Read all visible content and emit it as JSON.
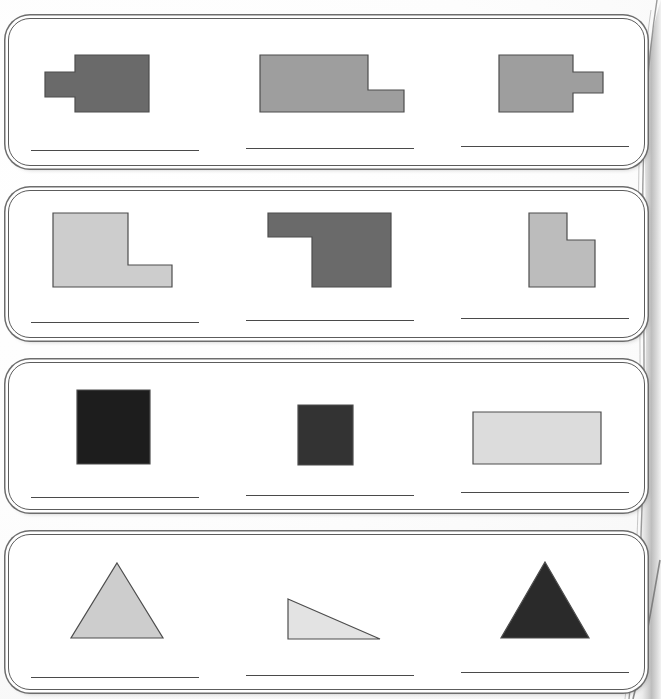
{
  "document": {
    "kind": "scanned-worksheet-page",
    "width": 661,
    "height": 699,
    "panel_count": 4,
    "shapes_per_panel": 3,
    "answer_lines_per_panel": 3
  },
  "palette": {
    "page_background": "#ffffff",
    "panel_fill": "#ffffff",
    "panel_border": "#5c5c5c",
    "panel_outer_border": "#6d6d6d",
    "answer_line": "#4a4a4a",
    "shape_outline": "#4d4d4d",
    "gray_dark": "#6a6a6a",
    "gray_medium": "#9e9e9e",
    "gray_light": "#bcbcbc",
    "gray_lighter": "#cdcdcd",
    "gray_palest": "#dcdcdc",
    "near_black": "#1d1d1d",
    "charcoal": "#333333"
  },
  "panels": [
    {
      "id": "panel-1",
      "index": 1,
      "frame": {
        "x": 8,
        "y": 18,
        "w": 637,
        "h": 148
      },
      "shapes": [
        {
          "id": "shape-1-1",
          "name": "rectangle-with-left-tab",
          "fill": "#6a6a6a",
          "box": {
            "x": 44,
            "y": 54,
            "w": 104,
            "h": 57
          },
          "viewbox": "0 0 104 57",
          "points": "30,0 104,0 104,57 30,57 30,42 0,42 0,17 30,17"
        },
        {
          "id": "shape-1-2",
          "name": "l-shape-step-down-right",
          "fill": "#9e9e9e",
          "box": {
            "x": 259,
            "y": 54,
            "w": 144,
            "h": 57
          },
          "viewbox": "0 0 144 57",
          "points": "0,0 108,0 108,35 144,35 144,57 0,57"
        },
        {
          "id": "shape-1-3",
          "name": "rectangle-with-right-tab",
          "fill": "#9e9e9e",
          "box": {
            "x": 498,
            "y": 54,
            "w": 104,
            "h": 57
          },
          "viewbox": "0 0 104 57",
          "points": "0,0 74,0 74,17 104,17 104,38 74,38 74,57 0,57"
        }
      ],
      "answer_lines": [
        {
          "x": 30,
          "y": 149,
          "w": 168
        },
        {
          "x": 245,
          "y": 147,
          "w": 168
        },
        {
          "x": 460,
          "y": 145,
          "w": 168
        }
      ]
    },
    {
      "id": "panel-2",
      "index": 2,
      "frame": {
        "x": 8,
        "y": 190,
        "w": 637,
        "h": 148
      },
      "shapes": [
        {
          "id": "shape-2-1",
          "name": "l-shape-notch-top-right",
          "fill": "#cdcdcd",
          "box": {
            "x": 52,
            "y": 212,
            "w": 119,
            "h": 74
          },
          "viewbox": "0 0 119 74",
          "points": "0,0 75,0 75,52 119,52 119,74 0,74"
        },
        {
          "id": "shape-2-2",
          "name": "l-shape-notch-bottom-left",
          "fill": "#6a6a6a",
          "box": {
            "x": 267,
            "y": 212,
            "w": 123,
            "h": 74
          },
          "viewbox": "0 0 123 74",
          "points": "0,0 123,0 123,74 44,74 44,24 0,24"
        },
        {
          "id": "shape-2-3",
          "name": "l-shape-notch-top-right-narrow",
          "fill": "#bcbcbc",
          "box": {
            "x": 528,
            "y": 212,
            "w": 66,
            "h": 74
          },
          "viewbox": "0 0 66 74",
          "points": "0,0 38,0 38,27 66,27 66,74 0,74"
        }
      ],
      "answer_lines": [
        {
          "x": 30,
          "y": 321,
          "w": 168
        },
        {
          "x": 245,
          "y": 319,
          "w": 168
        },
        {
          "x": 460,
          "y": 317,
          "w": 168
        }
      ]
    },
    {
      "id": "panel-3",
      "index": 3,
      "frame": {
        "x": 8,
        "y": 362,
        "w": 637,
        "h": 148
      },
      "shapes": [
        {
          "id": "shape-3-1",
          "name": "square-large-dark",
          "fill": "#1d1d1d",
          "box": {
            "x": 76,
            "y": 389,
            "w": 73,
            "h": 74
          },
          "viewbox": "0 0 73 74",
          "points": "0,0 73,0 73,74 0,74"
        },
        {
          "id": "shape-3-2",
          "name": "square-small-dark",
          "fill": "#333333",
          "box": {
            "x": 297,
            "y": 404,
            "w": 55,
            "h": 60
          },
          "viewbox": "0 0 55 60",
          "points": "0,0 55,0 55,60 0,60"
        },
        {
          "id": "shape-3-3",
          "name": "rectangle-wide-pale",
          "fill": "#dcdcdc",
          "box": {
            "x": 472,
            "y": 411,
            "w": 128,
            "h": 52
          },
          "viewbox": "0 0 128 52",
          "points": "0,0 128,0 128,52 0,52"
        }
      ],
      "answer_lines": [
        {
          "x": 30,
          "y": 496,
          "w": 168
        },
        {
          "x": 245,
          "y": 494,
          "w": 168
        },
        {
          "x": 460,
          "y": 491,
          "w": 168
        }
      ]
    },
    {
      "id": "panel-4",
      "index": 4,
      "frame": {
        "x": 8,
        "y": 534,
        "w": 637,
        "h": 156
      },
      "shapes": [
        {
          "id": "shape-4-1",
          "name": "triangle-isosceles-light",
          "fill": "#cdcdcd",
          "box": {
            "x": 70,
            "y": 562,
            "w": 92,
            "h": 75
          },
          "viewbox": "0 0 92 75",
          "points": "46,0 92,75 0,75"
        },
        {
          "id": "shape-4-2",
          "name": "triangle-right-angle-pale",
          "fill": "#e3e3e3",
          "box": {
            "x": 287,
            "y": 598,
            "w": 92,
            "h": 40
          },
          "viewbox": "0 0 92 40",
          "points": "0,0 92,40 0,40"
        },
        {
          "id": "shape-4-3",
          "name": "triangle-isosceles-dark",
          "fill": "#2a2a2a",
          "box": {
            "x": 500,
            "y": 561,
            "w": 88,
            "h": 76
          },
          "viewbox": "0 0 88 76",
          "points": "44,0 88,76 0,76"
        }
      ],
      "answer_lines": [
        {
          "x": 30,
          "y": 676,
          "w": 168
        },
        {
          "x": 245,
          "y": 674,
          "w": 168
        },
        {
          "x": 460,
          "y": 671,
          "w": 168
        }
      ]
    }
  ]
}
